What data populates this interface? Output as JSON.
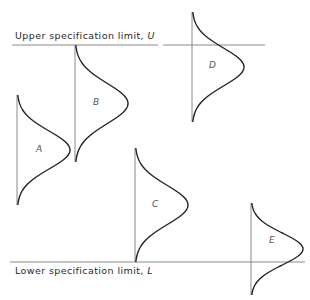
{
  "diagram": {
    "upper_limit": {
      "text": "Upper specification limit, ",
      "symbol": "U",
      "y": 45
    },
    "lower_limit": {
      "text": "Lower specification limit, ",
      "symbol": "L",
      "y": 262
    },
    "distributions": [
      {
        "label": "A",
        "base_x": 17,
        "top_y": 95,
        "bottom_y": 205,
        "peak_x": 70
      },
      {
        "label": "B",
        "base_x": 75,
        "top_y": 45,
        "bottom_y": 162,
        "peak_x": 128
      },
      {
        "label": "C",
        "base_x": 135,
        "top_y": 148,
        "bottom_y": 262,
        "peak_x": 188
      },
      {
        "label": "D",
        "base_x": 192,
        "top_y": 12,
        "bottom_y": 122,
        "peak_x": 244
      },
      {
        "label": "E",
        "base_x": 251,
        "top_y": 203,
        "bottom_y": 295,
        "peak_x": 303
      }
    ],
    "colors": {
      "line": "#8a8a8a",
      "curve": "#222222",
      "text": "#2a2a2a"
    }
  }
}
